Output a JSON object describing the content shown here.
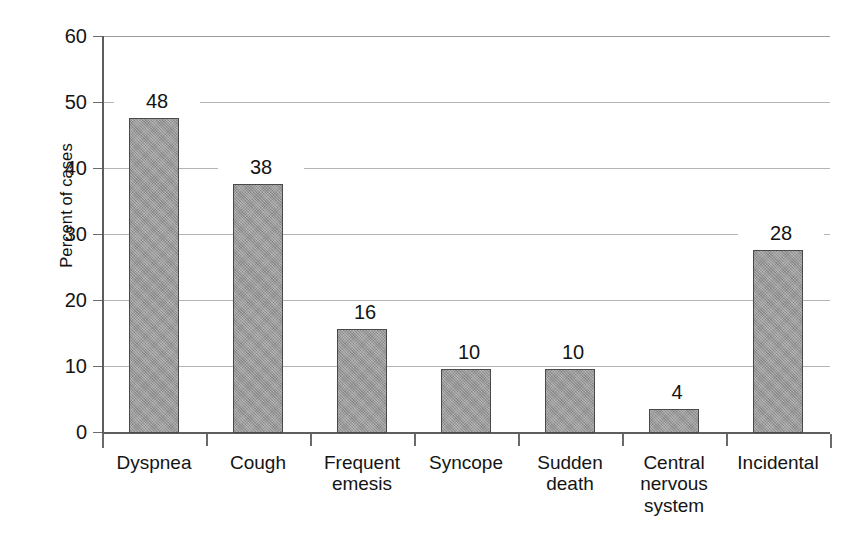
{
  "chart_data": {
    "type": "bar",
    "title": "",
    "subtitle": "",
    "xlabel": "",
    "ylabel": "Percent of cases",
    "categories": [
      "Dyspnea",
      "Cough",
      "Frequent\nemesis",
      "Syncope",
      "Sudden\ndeath",
      "Central\nnervous\nsystem",
      "Incidental"
    ],
    "values": [
      48,
      38,
      16,
      10,
      10,
      4,
      28
    ],
    "value_labels": [
      "48",
      "38",
      "16",
      "10",
      "10",
      "4",
      "28"
    ],
    "ylim": [
      0,
      60
    ],
    "ytick_labels": [
      "0",
      "10",
      "20",
      "30",
      "40",
      "50",
      "60"
    ],
    "ytick_values": [
      0,
      10,
      20,
      30,
      40,
      50,
      60
    ],
    "grid": true,
    "grid_axis": "y",
    "legend": false,
    "legend_position": "none",
    "bar_color": "#9a9a9a",
    "bar_border_color": "#4a4a4a",
    "grid_color": "#b4b4b4",
    "axis_color": "#5d5d5d",
    "text_color": "#141414",
    "background_color": "#ffffff"
  }
}
